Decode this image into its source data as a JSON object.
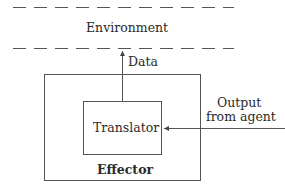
{
  "diagram": {
    "environment_label": "Environment",
    "data_label": "Data",
    "translator_label": "Translator",
    "effector_label": "Effector",
    "input_label_line1": "Output",
    "input_label_line2": "from agent"
  },
  "colors": {
    "line": "#555555",
    "text": "#2a2a2a",
    "background": "#ffffff"
  }
}
